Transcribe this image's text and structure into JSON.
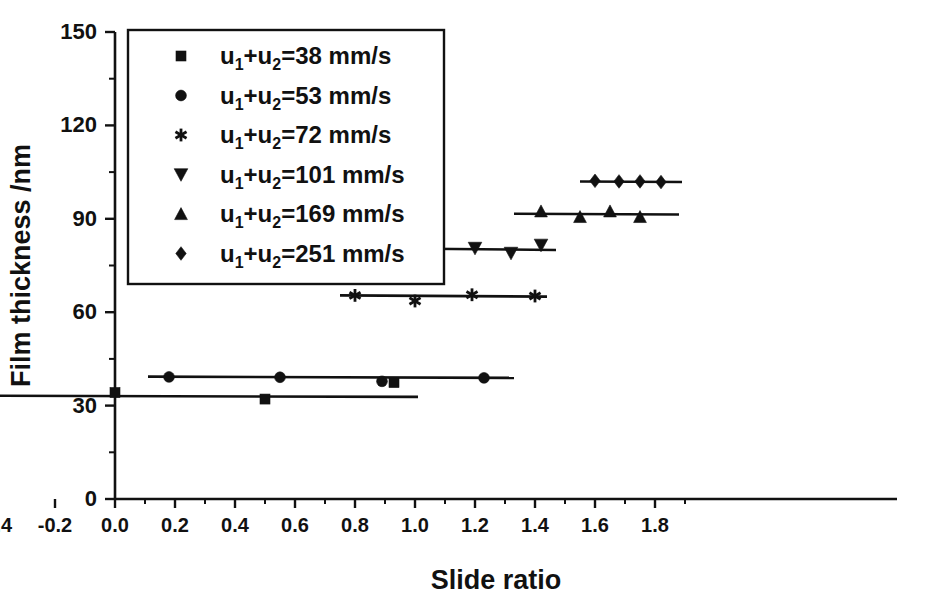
{
  "figure": {
    "background": "#ffffff",
    "ink_color": "#111111",
    "caption_marker": ""
  },
  "axes": {
    "x": {
      "label": "Slide ratio",
      "min": -0.72,
      "max": 1.9,
      "major_ticks": [
        -0.6,
        -0.4,
        -0.2,
        0.0,
        0.2,
        0.4,
        0.6,
        0.8,
        1.0,
        1.2,
        1.4,
        1.6,
        1.8
      ],
      "major_tick_labels": [
        "-0.6",
        "-0.4",
        "-0.2",
        "0.0",
        "0.2",
        "0.4",
        "0.6",
        "0.8",
        "1.0",
        "1.2",
        "1.4",
        "1.6",
        "1.8"
      ],
      "minor_tick_step": 0.1,
      "grid": false
    },
    "y": {
      "label": "Film thickness /nm",
      "min": 0,
      "max": 150,
      "major_ticks": [
        0,
        30,
        60,
        90,
        120,
        150
      ],
      "major_tick_labels": [
        "0",
        "30",
        "60",
        "90",
        "120",
        "150"
      ],
      "minor_tick_step": 15,
      "grid": false
    }
  },
  "legend": {
    "position": "upper-left-inside",
    "border": true,
    "entries": [
      {
        "marker": "square",
        "prefix": "u",
        "sub1": "1",
        "plus": "+u",
        "sub2": "2",
        "equals": "=38 mm/s",
        "label": "u1+u2=38 mm/s"
      },
      {
        "marker": "circle",
        "prefix": "u",
        "sub1": "1",
        "plus": "+u",
        "sub2": "2",
        "equals": "=53 mm/s",
        "label": "u1+u2=53 mm/s"
      },
      {
        "marker": "asterisk",
        "prefix": "u",
        "sub1": "1",
        "plus": "+u",
        "sub2": "2",
        "equals": "=72 mm/s",
        "label": "u1+u2=72 mm/s"
      },
      {
        "marker": "triangle-down",
        "prefix": "u",
        "sub1": "1",
        "plus": "+u",
        "sub2": "2",
        "equals": "=101 mm/s",
        "label": "u1+u2=101 mm/s"
      },
      {
        "marker": "triangle-up",
        "prefix": "u",
        "sub1": "1",
        "plus": "+u",
        "sub2": "2",
        "equals": "=169 mm/s",
        "label": "u1+u2=169 mm/s"
      },
      {
        "marker": "diamond",
        "prefix": "u",
        "sub1": "1",
        "plus": "+u",
        "sub2": "2",
        "equals": "=251 mm/s",
        "label": "u1+u2=251 mm/s"
      }
    ]
  },
  "chart_data": {
    "type": "scatter",
    "title": "",
    "subtitle": "",
    "xlabel": "Slide ratio",
    "ylabel": "Film thickness /nm",
    "xlim": [
      -0.72,
      1.9
    ],
    "ylim": [
      0,
      150
    ],
    "grid": false,
    "legend_position": "upper-left-inside",
    "series": [
      {
        "name": "u1+u2=38 mm/s",
        "marker": "square",
        "fit_line": {
          "x_start": -0.62,
          "x_end": 1.01,
          "y_start": 33.2,
          "y_end": 32.8
        },
        "points": [
          {
            "x": -0.56,
            "y": 33.0
          },
          {
            "x": 0.0,
            "y": 34.2
          },
          {
            "x": 0.5,
            "y": 32.1
          },
          {
            "x": 0.93,
            "y": 37.4
          }
        ]
      },
      {
        "name": "u1+u2=53 mm/s",
        "marker": "circle",
        "fit_line": {
          "x_start": 0.11,
          "x_end": 1.33,
          "y_start": 39.3,
          "y_end": 38.9
        },
        "points": [
          {
            "x": 0.18,
            "y": 39.2
          },
          {
            "x": 0.55,
            "y": 39.1
          },
          {
            "x": 0.89,
            "y": 37.8
          },
          {
            "x": 1.23,
            "y": 38.9
          }
        ]
      },
      {
        "name": "u1+u2=72 mm/s",
        "marker": "asterisk",
        "fit_line": {
          "x_start": 0.75,
          "x_end": 1.44,
          "y_start": 65.4,
          "y_end": 65.0
        },
        "points": [
          {
            "x": 0.8,
            "y": 65.4
          },
          {
            "x": 1.0,
            "y": 63.6
          },
          {
            "x": 1.19,
            "y": 65.6
          },
          {
            "x": 1.4,
            "y": 65.2
          }
        ]
      },
      {
        "name": "u1+u2=101 mm/s",
        "marker": "triangle-down",
        "fit_line": {
          "x_start": 1.03,
          "x_end": 1.47,
          "y_start": 80.4,
          "y_end": 80.0
        },
        "points": [
          {
            "x": 1.05,
            "y": 78.6
          },
          {
            "x": 1.2,
            "y": 80.6
          },
          {
            "x": 1.32,
            "y": 79.0
          },
          {
            "x": 1.42,
            "y": 81.6
          }
        ]
      },
      {
        "name": "u1+u2=169 mm/s",
        "marker": "triangle-up",
        "fit_line": {
          "x_start": 1.33,
          "x_end": 1.88,
          "y_start": 91.6,
          "y_end": 91.4
        },
        "points": [
          {
            "x": 1.42,
            "y": 92.4
          },
          {
            "x": 1.55,
            "y": 90.6
          },
          {
            "x": 1.65,
            "y": 92.4
          },
          {
            "x": 1.75,
            "y": 90.6
          }
        ]
      },
      {
        "name": "u1+u2=251 mm/s",
        "marker": "diamond",
        "fit_line": {
          "x_start": 1.55,
          "x_end": 1.89,
          "y_start": 102.0,
          "y_end": 101.8
        },
        "points": [
          {
            "x": 1.6,
            "y": 102.2
          },
          {
            "x": 1.68,
            "y": 102.0
          },
          {
            "x": 1.75,
            "y": 102.0
          },
          {
            "x": 1.82,
            "y": 101.8
          }
        ]
      }
    ]
  }
}
